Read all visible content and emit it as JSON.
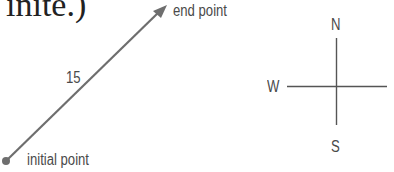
{
  "header_fragment": "inite.)",
  "vector": {
    "magnitude_label": "15",
    "end_label": "end point",
    "start_label": "initial point",
    "color": "#6e6e6e"
  },
  "compass": {
    "north": "N",
    "south": "S",
    "west": "W",
    "color": "#555555"
  }
}
